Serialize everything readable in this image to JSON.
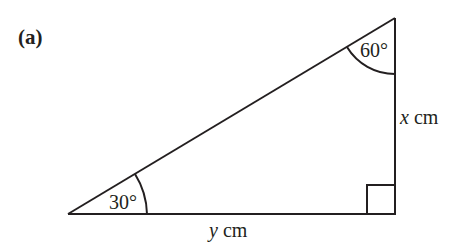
{
  "part_label": "(a)",
  "triangle": {
    "vertices": {
      "bottom_left": [
        68,
        214
      ],
      "top_right": [
        395,
        18
      ],
      "bottom_right_right_angle": [
        395,
        214
      ]
    },
    "angles": {
      "bottom_left": {
        "value": "30°",
        "label": "30°"
      },
      "top": {
        "value": "60°",
        "label": "60°"
      },
      "bottom_right": {
        "value": "90°",
        "marker": "right-angle-square"
      }
    },
    "sides": {
      "vertical": {
        "var": "x",
        "unit": " cm"
      },
      "base": {
        "var": "y",
        "unit": " cm"
      }
    }
  },
  "colors": {
    "line": "#231f20",
    "background": "#ffffff"
  }
}
